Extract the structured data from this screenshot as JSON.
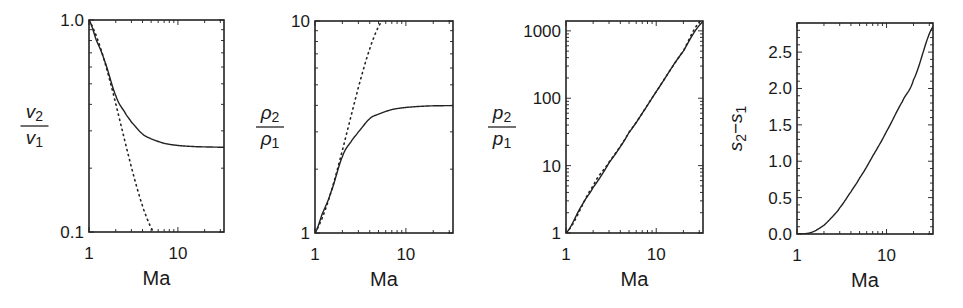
{
  "chart_data": [
    {
      "type": "line",
      "id": "velocity-ratio",
      "title": "",
      "xlabel": "Ma",
      "ylabel": "v2/v1",
      "ylabel_parts": {
        "num": "v",
        "num_sub": "2",
        "den": "v",
        "den_sub": "1"
      },
      "xscale": "log",
      "yscale": "log",
      "xlim": [
        1,
        33
      ],
      "ylim": [
        0.1,
        1.0
      ],
      "xticks": [
        1,
        10
      ],
      "xtick_labels": [
        "1",
        "10"
      ],
      "yticks": [
        0.1,
        1.0
      ],
      "ytick_labels": [
        "0.1",
        "1.0"
      ],
      "grid": false,
      "box": {
        "x0": 89,
        "x1": 224,
        "y0": 20,
        "y1": 232
      },
      "series": [
        {
          "name": "shock (solid)",
          "style": "solid",
          "x": [
            1,
            1.2,
            1.5,
            2,
            2.5,
            3,
            4,
            5,
            7,
            10,
            15,
            20,
            33
          ],
          "y": [
            1.0,
            0.81,
            0.64,
            0.44,
            0.37,
            0.33,
            0.29,
            0.275,
            0.262,
            0.256,
            0.253,
            0.252,
            0.251
          ]
        },
        {
          "name": "asymptote (dotted)",
          "style": "dotted",
          "x": [
            1,
            5.3
          ],
          "y": [
            1.0,
            0.1
          ]
        }
      ]
    },
    {
      "type": "line",
      "id": "density-ratio",
      "title": "",
      "xlabel": "Ma",
      "ylabel": "rho2/rho1",
      "ylabel_parts": {
        "num": "ρ",
        "num_sub": "2",
        "den": "ρ",
        "den_sub": "1"
      },
      "xscale": "log",
      "yscale": "log",
      "xlim": [
        1,
        33
      ],
      "ylim": [
        1,
        10
      ],
      "xticks": [
        1,
        10
      ],
      "xtick_labels": [
        "1",
        "10"
      ],
      "yticks": [
        1,
        10
      ],
      "ytick_labels": [
        "1",
        "10"
      ],
      "grid": false,
      "box": {
        "x0": 315,
        "x1": 453,
        "y0": 21,
        "y1": 233
      },
      "series": [
        {
          "name": "shock (solid)",
          "style": "solid",
          "x": [
            1,
            1.2,
            1.5,
            2,
            2.5,
            3,
            4,
            5,
            7,
            10,
            15,
            20,
            33
          ],
          "y": [
            1.0,
            1.23,
            1.56,
            2.29,
            2.7,
            3.0,
            3.46,
            3.64,
            3.82,
            3.91,
            3.96,
            3.98,
            3.99
          ]
        },
        {
          "name": "asymptote (dotted)",
          "style": "dotted",
          "x": [
            1,
            5.4
          ],
          "y": [
            1.0,
            10.0
          ]
        }
      ]
    },
    {
      "type": "line",
      "id": "pressure-ratio",
      "title": "",
      "xlabel": "Ma",
      "ylabel": "p2/p1",
      "ylabel_parts": {
        "num": "p",
        "num_sub": "2",
        "den": "p",
        "den_sub": "1"
      },
      "xscale": "log",
      "yscale": "log",
      "xlim": [
        1,
        33
      ],
      "ylim": [
        1,
        1400
      ],
      "xticks": [
        1,
        10
      ],
      "xtick_labels": [
        "1",
        "10"
      ],
      "yticks": [
        1,
        10,
        100,
        1000
      ],
      "ytick_labels": [
        "1",
        "10",
        "100",
        "1000"
      ],
      "grid": false,
      "box": {
        "x0": 566,
        "x1": 703,
        "y0": 21,
        "y1": 233
      },
      "series": [
        {
          "name": "shock (solid)",
          "style": "solid",
          "x": [
            1,
            1.5,
            2,
            3,
            5,
            10,
            20,
            33
          ],
          "y": [
            1.0,
            2.56,
            4.75,
            11,
            31,
            125,
            500,
            1361
          ]
        },
        {
          "name": "asymptote (dotted)",
          "style": "dotted",
          "x": [
            1,
            2,
            3,
            5,
            10,
            20,
            31
          ],
          "y": [
            1.0,
            5.0,
            11.3,
            31.3,
            125,
            500,
            1400
          ]
        }
      ]
    },
    {
      "type": "line",
      "id": "entropy-jump",
      "title": "",
      "xlabel": "Ma",
      "ylabel": "s2-s1",
      "ylabel_parts": {
        "a": "s",
        "a_sub": "2",
        "op": "−",
        "b": "s",
        "b_sub": "1"
      },
      "xscale": "log",
      "yscale": "linear",
      "xlim": [
        1,
        33
      ],
      "ylim": [
        0.0,
        2.9
      ],
      "xticks": [
        1,
        10
      ],
      "xtick_labels": [
        "1",
        "10"
      ],
      "yticks": [
        0.0,
        0.5,
        1.0,
        1.5,
        2.0,
        2.5
      ],
      "ytick_labels": [
        "0.0",
        "0.5",
        "1.0",
        "1.5",
        "2.0",
        "2.5"
      ],
      "grid": false,
      "box": {
        "x0": 797,
        "x1": 933,
        "y0": 23,
        "y1": 234
      },
      "series": [
        {
          "name": "entropy (solid)",
          "style": "solid",
          "x": [
            1,
            1.2,
            1.5,
            2,
            2.5,
            3,
            4,
            5,
            7,
            10,
            15,
            20,
            33
          ],
          "y": [
            0.0,
            0.003,
            0.03,
            0.12,
            0.24,
            0.36,
            0.58,
            0.77,
            1.07,
            1.41,
            1.82,
            2.12,
            2.85
          ]
        }
      ]
    }
  ]
}
